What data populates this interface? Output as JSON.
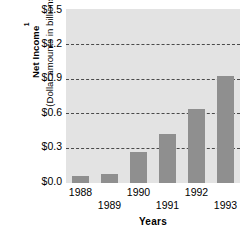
{
  "chart_data": {
    "type": "bar",
    "title": "",
    "categories": [
      "1988",
      "1989",
      "1990",
      "1991",
      "1992",
      "1993"
    ],
    "values": [
      0.06,
      0.08,
      0.27,
      0.42,
      0.64,
      0.92
    ],
    "xlabel": "Years",
    "ylabel_main": "Net Income",
    "ylabel_superscript": "1",
    "ylabel_sub": "(Dollar amounts in billions)",
    "ytick_labels": [
      "$1.5",
      "$1.2",
      "$0.9",
      "$0.6",
      "$0.3",
      "$0.0"
    ],
    "ytick_values": [
      1.5,
      1.2,
      0.9,
      0.6,
      0.3,
      0.0
    ],
    "ylim": [
      0.0,
      1.5
    ],
    "gridlines": [
      1.2,
      0.9,
      0.6,
      0.3
    ],
    "grid": true,
    "legend": null,
    "legend_position": "none",
    "xtick_stagger": [
      0,
      1,
      0,
      1,
      0,
      1
    ],
    "colors": {
      "bar": "#8f8f8f",
      "plot_background": "#e3e3e3",
      "gridline": "#4a4a4a",
      "page_background": "#ffffff",
      "text": "#000000"
    }
  }
}
